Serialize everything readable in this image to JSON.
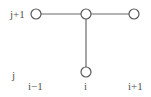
{
  "diagram": {
    "type": "finite-difference stencil",
    "row_labels": {
      "top": "j+1",
      "bottom": "j"
    },
    "column_labels": {
      "left": "i−1",
      "center": "i",
      "right": "i+1"
    },
    "nodes": [
      {
        "id": "n_im1_jp1",
        "label": "(i-1, j+1)",
        "cx": 36,
        "cy": 14
      },
      {
        "id": "n_i_jp1",
        "label": "(i, j+1)",
        "cx": 86,
        "cy": 14
      },
      {
        "id": "n_ip1_jp1",
        "label": "(i+1, j+1)",
        "cx": 134,
        "cy": 14
      },
      {
        "id": "n_i_j",
        "label": "(i, j)",
        "cx": 86,
        "cy": 72
      }
    ],
    "edges": [
      {
        "from": "n_im1_jp1",
        "to": "n_i_jp1"
      },
      {
        "from": "n_i_jp1",
        "to": "n_ip1_jp1"
      },
      {
        "from": "n_i_jp1",
        "to": "n_i_j"
      }
    ],
    "colors": {
      "line": "#6a6a6a",
      "node_stroke": "#5a5a5a",
      "text": "#555555",
      "background": "#ffffff"
    }
  }
}
